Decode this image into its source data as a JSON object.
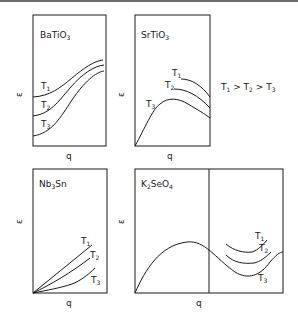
{
  "figure": {
    "relation": {
      "t1": "T",
      "t1_sub": "1",
      "gt1": " > ",
      "t2": "T",
      "t2_sub": "2",
      "gt2": " > ",
      "t3": "T",
      "t3_sub": "3"
    },
    "panels": [
      {
        "id": "batio3",
        "title_main": "BaTiO",
        "title_sub": "3",
        "title_tail": "",
        "xlabel": "q",
        "ylabel": "ε",
        "curves": [
          "T1",
          "T2",
          "T3"
        ]
      },
      {
        "id": "srtio3",
        "title_main": "SrTiO",
        "title_sub": "3",
        "title_tail": "",
        "xlabel": "q",
        "ylabel": "ε",
        "curves": [
          "T1",
          "T2",
          "T3"
        ]
      },
      {
        "id": "nb3sn",
        "title_main": "Nb",
        "title_sub": "3",
        "title_tail": "Sn",
        "xlabel": "q",
        "ylabel": "ε",
        "curves": [
          "T1",
          "T2",
          "T3"
        ]
      },
      {
        "id": "k2seo4",
        "title_main": "K",
        "title_sub": "2",
        "title_tail": "SeO",
        "title_sub2": "4",
        "xlabel": "q",
        "ylabel": "ε",
        "curves": [
          "T1",
          "T2",
          "T3"
        ]
      }
    ],
    "curve_labels": {
      "T": "T",
      "s1": "1",
      "s2": "2",
      "s3": "3"
    }
  }
}
